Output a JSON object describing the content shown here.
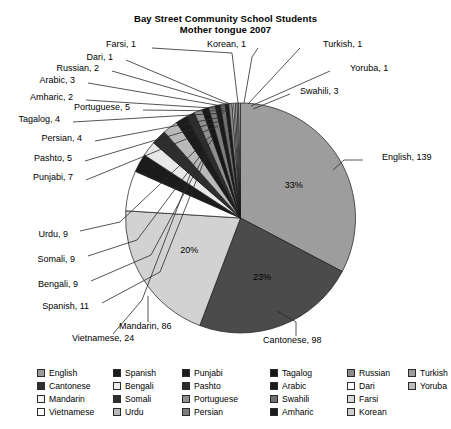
{
  "title": {
    "line1": "Bay Street Community School Students",
    "line2": "Mother tongue 2007"
  },
  "chart_data": {
    "type": "pie",
    "title": "Bay Street Community School Students Mother tongue 2007",
    "xlabel": "",
    "ylabel": "",
    "total": 420,
    "legend_position": "bottom",
    "grid": false,
    "categories": [
      "English",
      "Cantonese",
      "Mandarin",
      "Vietnamese",
      "Spanish",
      "Bengali",
      "Somali",
      "Urdu",
      "Punjabi",
      "Pashto",
      "Portuguese",
      "Tagalog",
      "Persian",
      "Arabic",
      "Swahili",
      "Amharic",
      "Russian",
      "Dari",
      "Farsi",
      "Korean",
      "Turkish",
      "Yoruba"
    ],
    "values": [
      139,
      98,
      86,
      24,
      11,
      9,
      9,
      9,
      7,
      5,
      5,
      4,
      4,
      3,
      3,
      2,
      2,
      1,
      1,
      1,
      1,
      1
    ],
    "colors": [
      "#9d9d9d",
      "#4b4b4b",
      "#d2d2d2",
      "#ffffff",
      "#1b1b1b",
      "#e8e8e8",
      "#2e2e2e",
      "#b9b9b9",
      "#1b1b1b",
      "#2e2e2e",
      "#8f8f8f",
      "#161616",
      "#7d7d7d",
      "#1b1b1b",
      "#6f6f6f",
      "#1b1b1b",
      "#8a8a8a",
      "#ffffff",
      "#d8d8d8",
      "#cfcfcf",
      "#9d9d9d",
      "#bdbdbd"
    ],
    "slice_labels": [
      {
        "name": "English",
        "text": "English, 139"
      },
      {
        "name": "Cantonese",
        "text": "Cantonese, 98"
      },
      {
        "name": "Mandarin",
        "text": "Mandarin, 86"
      },
      {
        "name": "Vietnamese",
        "text": "Vietnamese, 24"
      },
      {
        "name": "Spanish",
        "text": "Spanish, 11"
      },
      {
        "name": "Bengali",
        "text": "Bengali, 9"
      },
      {
        "name": "Somali",
        "text": "Somali, 9"
      },
      {
        "name": "Urdu",
        "text": "Urdu, 9"
      },
      {
        "name": "Punjabi",
        "text": "Punjabi, 7"
      },
      {
        "name": "Pashto",
        "text": "Pashto, 5"
      },
      {
        "name": "Persian",
        "text": "Persian, 4"
      },
      {
        "name": "Tagalog",
        "text": "Tagalog, 4"
      },
      {
        "name": "Portuguese",
        "text": "Portuguese, 5"
      },
      {
        "name": "Amharic",
        "text": "Amharic, 2"
      },
      {
        "name": "Arabic",
        "text": "Arabic, 3"
      },
      {
        "name": "Russian",
        "text": "Russian, 2"
      },
      {
        "name": "Dari",
        "text": "Dari, 1"
      },
      {
        "name": "Farsi",
        "text": "Farsi, 1"
      },
      {
        "name": "Korean",
        "text": "Korean, 1"
      },
      {
        "name": "Turkish",
        "text": "Turkish, 1"
      },
      {
        "name": "Yoruba",
        "text": "Yoruba, 1"
      },
      {
        "name": "Swahili",
        "text": "Swahili, 3"
      }
    ],
    "percent_labels": [
      {
        "name": "English",
        "text": "33%"
      },
      {
        "name": "Cantonese",
        "text": "23%"
      },
      {
        "name": "Mandarin",
        "text": "20%"
      }
    ]
  },
  "legend": {
    "columns": [
      [
        "English",
        "Cantonese",
        "Mandarin",
        "Vietnamese"
      ],
      [
        "Spanish",
        "Bengali",
        "Somali",
        "Urdu"
      ],
      [
        "Punjabi",
        "Pashto",
        "Portuguese",
        "Persian"
      ],
      [
        "Tagalog",
        "Arabic",
        "Swahili",
        "Amharic"
      ],
      [
        "Russian",
        "Dari",
        "Farsi",
        "Korean"
      ],
      [
        "Turkish",
        "Yoruba"
      ]
    ],
    "swatches": [
      [
        "#9d9d9d",
        "#2e2e2e",
        "#f2f2f2",
        "#ffffff"
      ],
      [
        "#1b1b1b",
        "#ededed",
        "#2e2e2e",
        "#b9b9b9"
      ],
      [
        "#1b1b1b",
        "#2e2e2e",
        "#8f8f8f",
        "#7d7d7d"
      ],
      [
        "#161616",
        "#1b1b1b",
        "#6f6f6f",
        "#1b1b1b"
      ],
      [
        "#8a8a8a",
        "#ffffff",
        "#d8d8d8",
        "#cfcfcf"
      ],
      [
        "#9d9d9d",
        "#bdbdbd"
      ]
    ]
  }
}
